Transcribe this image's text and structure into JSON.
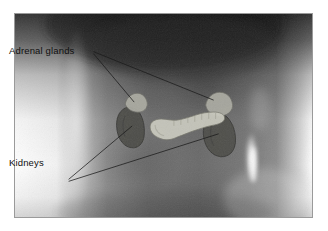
{
  "figure": {
    "type": "annotated-radiograph",
    "frame": {
      "border_color": "#9a9a9a",
      "background": "#ffffff"
    }
  },
  "labels": {
    "adrenal": "Adrenal glands",
    "kidneys": "Kidneys"
  },
  "overlay_colors": {
    "adrenal_gland": "#a9a9a1",
    "kidney": "#4a4a46",
    "pancreas": "#c9c9bd",
    "leader_line": "#1a1a1a",
    "xray_dark": "#1d1d1d",
    "xray_mid": "#6b6b6b",
    "xray_light": "#d8d8d8",
    "xray_highlight": "#ffffff"
  },
  "structures": [
    {
      "name": "left-adrenal-gland",
      "tone": "light"
    },
    {
      "name": "left-kidney",
      "tone": "dark"
    },
    {
      "name": "right-adrenal-gland",
      "tone": "light"
    },
    {
      "name": "right-kidney",
      "tone": "dark"
    },
    {
      "name": "pancreas",
      "tone": "light"
    }
  ],
  "leader_lines": [
    {
      "from": "adrenal-label",
      "to": "left-adrenal-gland"
    },
    {
      "from": "adrenal-label",
      "to": "right-adrenal-gland"
    },
    {
      "from": "kidneys-label",
      "to": "left-kidney"
    },
    {
      "from": "kidneys-label",
      "to": "right-kidney"
    }
  ]
}
